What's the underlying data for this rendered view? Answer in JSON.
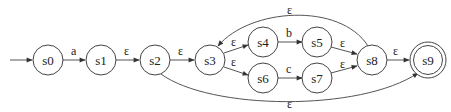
{
  "diagram": {
    "type": "nfa-state-diagram",
    "start_state": "s0",
    "accept_states": [
      "s9"
    ],
    "nodes": [
      {
        "id": "s0",
        "label": "s0",
        "x": 48,
        "y": 60,
        "accept": false
      },
      {
        "id": "s1",
        "label": "s1",
        "x": 101,
        "y": 60,
        "accept": false
      },
      {
        "id": "s2",
        "label": "s2",
        "x": 155,
        "y": 60,
        "accept": false
      },
      {
        "id": "s3",
        "label": "s3",
        "x": 210,
        "y": 60,
        "accept": false
      },
      {
        "id": "s4",
        "label": "s4",
        "x": 263,
        "y": 42,
        "accept": false
      },
      {
        "id": "s5",
        "label": "s5",
        "x": 317,
        "y": 42,
        "accept": false
      },
      {
        "id": "s6",
        "label": "s6",
        "x": 263,
        "y": 78,
        "accept": false
      },
      {
        "id": "s7",
        "label": "s7",
        "x": 317,
        "y": 78,
        "accept": false
      },
      {
        "id": "s8",
        "label": "s8",
        "x": 372,
        "y": 60,
        "accept": false
      },
      {
        "id": "s9",
        "label": "s9",
        "x": 428,
        "y": 60,
        "accept": true
      }
    ],
    "edges": [
      {
        "from": "start",
        "to": "s0",
        "label": ""
      },
      {
        "from": "s0",
        "to": "s1",
        "label": "a"
      },
      {
        "from": "s1",
        "to": "s2",
        "label": "ε"
      },
      {
        "from": "s2",
        "to": "s3",
        "label": "ε"
      },
      {
        "from": "s3",
        "to": "s4",
        "label": "ε"
      },
      {
        "from": "s3",
        "to": "s6",
        "label": "ε"
      },
      {
        "from": "s4",
        "to": "s5",
        "label": "b"
      },
      {
        "from": "s6",
        "to": "s7",
        "label": "c"
      },
      {
        "from": "s5",
        "to": "s8",
        "label": "ε"
      },
      {
        "from": "s7",
        "to": "s8",
        "label": "ε"
      },
      {
        "from": "s8",
        "to": "s9",
        "label": "ε"
      },
      {
        "from": "s8",
        "to": "s3",
        "label": "ε"
      },
      {
        "from": "s2",
        "to": "s9",
        "label": "ε"
      }
    ]
  }
}
